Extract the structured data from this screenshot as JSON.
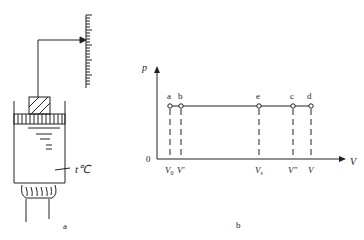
{
  "figure_a": {
    "caption": "a",
    "temperature_label": "t℃",
    "scale_ticks": 24
  },
  "figure_b": {
    "caption": "b",
    "y_axis_label": "p",
    "x_axis_label": "V",
    "origin_label": "0",
    "points": [
      {
        "name": "a",
        "x_label": "V",
        "x_sub": "0"
      },
      {
        "name": "b",
        "x_label": "V′",
        "x_sub": ""
      },
      {
        "name": "e",
        "x_label": "V",
        "x_sub": "s"
      },
      {
        "name": "c",
        "x_label": "V″",
        "x_sub": ""
      },
      {
        "name": "d",
        "x_label": "V",
        "x_sub": ""
      }
    ]
  },
  "colors": {
    "line": "#222222",
    "background": "#ffffff"
  }
}
